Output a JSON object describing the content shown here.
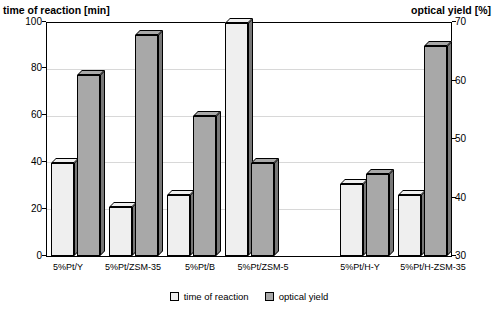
{
  "titles": {
    "left_axis_title": "time of reaction [min]",
    "right_axis_title": "optical yield [%]"
  },
  "legend": {
    "items": [
      {
        "label": "time of reaction",
        "color": "#efefef"
      },
      {
        "label": "optical yield",
        "color": "#a8a8a8"
      }
    ]
  },
  "axes": {
    "left_ticks": [
      "0",
      "20",
      "40",
      "60",
      "80",
      "100"
    ],
    "right_ticks": [
      "30",
      "40",
      "50",
      "60",
      "70"
    ]
  },
  "chart_data": {
    "type": "bar",
    "title": "",
    "categories": [
      "5%Pt/Y",
      "5%Pt/ZSM-35",
      "5%Pt/B",
      "5%Pt/ZSM-5",
      "",
      "5%Pt/H-Y",
      "5%Pt/H-ZSM-35"
    ],
    "series": [
      {
        "name": "time of reaction",
        "color": "#efefef",
        "values": [
          40,
          21,
          26,
          100,
          null,
          31,
          26
        ]
      },
      {
        "name": "optical yield",
        "color": "#a8a8a8",
        "values": [
          61,
          68,
          54,
          46,
          null,
          44,
          66
        ]
      }
    ],
    "ylabel": "time of reaction [min]",
    "ylabel_secondary": "optical yield [%]",
    "ylim": [
      0,
      100
    ],
    "ylim_secondary": [
      30,
      70
    ],
    "xlabel": "",
    "grid": true,
    "legend_position": "bottom"
  }
}
